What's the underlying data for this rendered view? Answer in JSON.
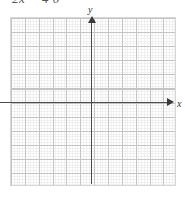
{
  "canvas": {
    "width": 185,
    "height": 198,
    "background_color": "#ffffff"
  },
  "equation": {
    "text": "2x − 4 0",
    "note_clipped": "top of text cut off by image edge",
    "color": "#555555"
  },
  "graph": {
    "axis_label_y": "y",
    "axis_label_x": "x",
    "axis_color": "#4a4a4a",
    "major_grid_color": "#c4c4c4",
    "minor_grid_color": "#aaaaaa",
    "border_color": "#d6d6d6"
  },
  "chart_data": {
    "type": "line",
    "title": "",
    "xlabel": "x",
    "ylabel": "y",
    "xlim": [
      -6,
      6
    ],
    "ylim": [
      -6,
      6
    ],
    "grid": true,
    "major_gridlines_x": 12,
    "major_gridlines_y": 12,
    "minor_per_major": 5,
    "legend": "none",
    "series": [],
    "annotations": []
  }
}
